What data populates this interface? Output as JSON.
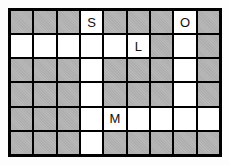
{
  "puzzle": {
    "type": "crossword-style letter grid",
    "columns": 9,
    "rows": 6,
    "colors": {
      "blocked_fill": "#b2b2b2",
      "open_fill": "#ffffff",
      "grid_line": "#000000",
      "letter_color": "#111111",
      "page_background": "#fdfdfd"
    },
    "cells": [
      [
        "G",
        "G",
        "G",
        "S",
        "G",
        "G",
        "G",
        "O",
        "G"
      ],
      [
        "W",
        "W",
        "W",
        "W",
        "W",
        "L",
        "G",
        "W",
        "G"
      ],
      [
        "G",
        "G",
        "G",
        "W",
        "G",
        "G",
        "G",
        "W",
        "G"
      ],
      [
        "G",
        "G",
        "G",
        "W",
        "G",
        "G",
        "G",
        "W",
        "G"
      ],
      [
        "G",
        "G",
        "G",
        "W",
        "M",
        "W",
        "W",
        "W",
        "W"
      ],
      [
        "G",
        "G",
        "G",
        "W",
        "G",
        "G",
        "G",
        "G",
        "G"
      ]
    ],
    "legend": {
      "G": "blocked gray cell",
      "W": "open white cell",
      "letter": "open white cell containing that letter"
    },
    "letters": [
      {
        "row": 1,
        "col": 4,
        "letter": "S"
      },
      {
        "row": 1,
        "col": 8,
        "letter": "O"
      },
      {
        "row": 2,
        "col": 6,
        "letter": "L"
      },
      {
        "row": 5,
        "col": 5,
        "letter": "M"
      }
    ]
  }
}
